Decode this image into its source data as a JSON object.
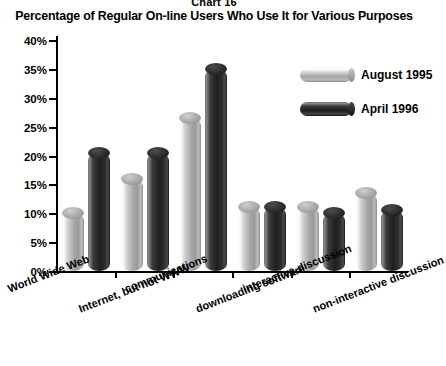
{
  "chart_number": "Chart 16",
  "title": "Percentage of Regular On-line Users Who Use It for Various Purposes",
  "legend": {
    "items": [
      {
        "label": "August 1995",
        "swatch": "light-cylinder-swatch",
        "color": "#a5a5a5"
      },
      {
        "label": "April 1996",
        "swatch": "dark-cylinder-swatch",
        "color": "#1f1f1f"
      }
    ]
  },
  "yaxis": {
    "ticks": [
      "0%",
      "5%",
      "10%",
      "15%",
      "20%",
      "25%",
      "30%",
      "35%",
      "40%"
    ],
    "min": 0,
    "max": 40
  },
  "chart_data": {
    "type": "bar",
    "title": "Percentage of Regular On-line Users Who Use It for Various Purposes",
    "xlabel": "",
    "ylabel": "",
    "ylim": [
      0,
      40
    ],
    "grid": false,
    "legend_position": "top-right",
    "categories": [
      "World Wide Web",
      "Internet, but not WWW",
      "communications",
      "downloading software",
      "interactive discussion",
      "non-interactive discussion"
    ],
    "series": [
      {
        "name": "August 1995",
        "color": "#a5a5a5",
        "values": [
          10,
          16,
          26.5,
          11,
          11,
          13.5
        ]
      },
      {
        "name": "April 1996",
        "color": "#1f1f1f",
        "values": [
          20.5,
          20.5,
          35,
          11,
          10,
          10.5
        ]
      }
    ]
  }
}
